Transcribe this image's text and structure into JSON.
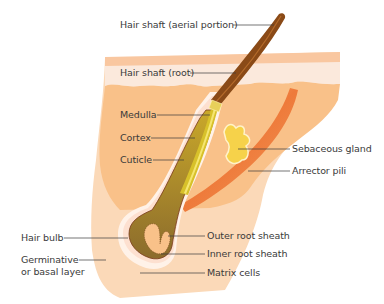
{
  "diagram": {
    "type": "anatomical-cross-section",
    "colors": {
      "skin_epidermis_top": "#f9c7a0",
      "skin_epidermis_pale": "#fbe9dc",
      "skin_dermis": "#f9c189",
      "skin_hypodermis": "#fbd9b8",
      "hair_shaft": "#8a4a17",
      "hair_shaft_highlight": "#b46a2a",
      "hair_core": "#d8c12a",
      "hair_bulb": "#8b6b2c",
      "sheath": "#fff2e8",
      "sebaceous_gland": "#f6d24a",
      "arrector_pili": "#ee7a3a",
      "leader_line": "#3a3a3a",
      "label_text": "#3a3a3a"
    },
    "labels": {
      "hair_shaft_aerial": "Hair shaft (aerial portion)",
      "hair_shaft_root": "Hair shaft (root)",
      "medulla": "Medulla",
      "cortex": "Cortex",
      "cuticle": "Cuticle",
      "sebaceous_gland": "Sebaceous gland",
      "arrector_pili": "Arrector pili",
      "hair_bulb": "Hair bulb",
      "germinative_line1": "Germinative",
      "germinative_line2": "or basal layer",
      "outer_root_sheath": "Outer root sheath",
      "inner_root_sheath": "Inner root sheath",
      "matrix_cells": "Matrix cells"
    }
  }
}
